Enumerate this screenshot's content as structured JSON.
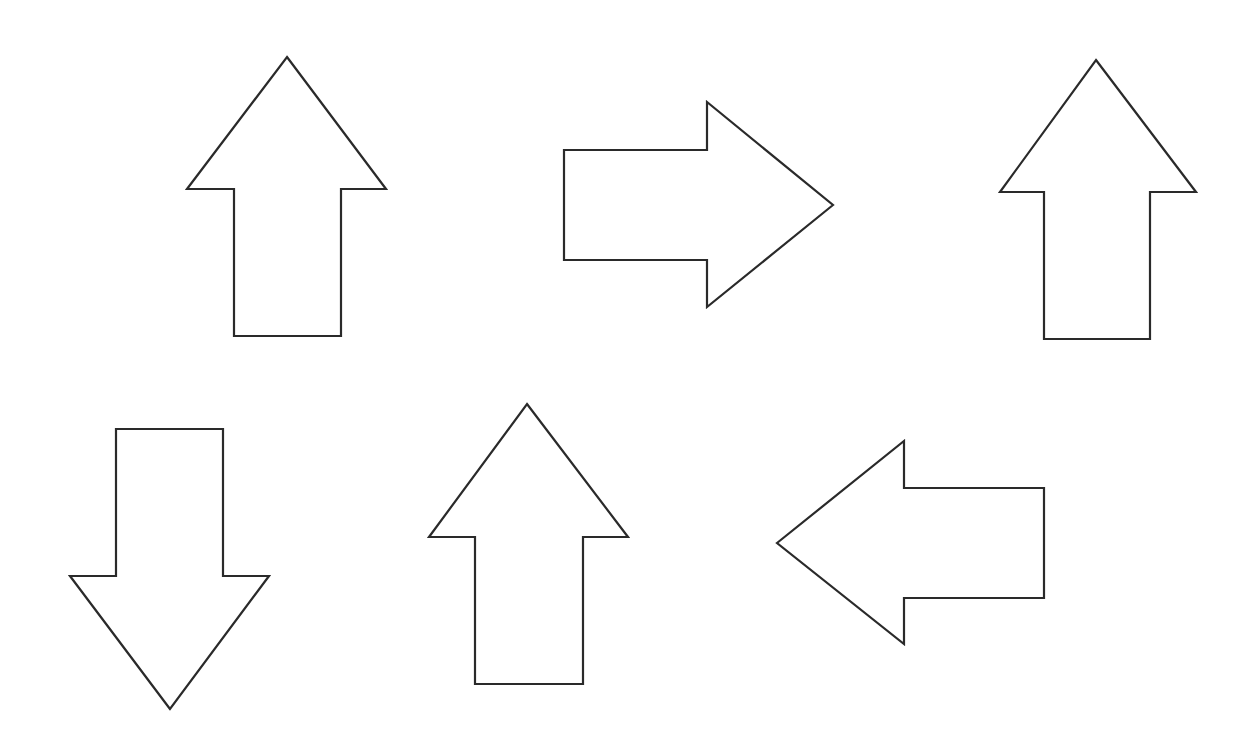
{
  "canvas": {
    "width": 1256,
    "height": 747,
    "background": "#ffffff",
    "stroke_color": "#2a2a2a",
    "fill_color": "#ffffff"
  },
  "arrows": [
    {
      "id": "arrow-1",
      "direction": "up",
      "position": "top-left",
      "points": "287,57 386,189 341,189 341,336 234,336 234,189 187,189"
    },
    {
      "id": "arrow-2",
      "direction": "right",
      "position": "top-center",
      "points": "833,205 707,307 707,260 564,260 564,150 707,150 707,102"
    },
    {
      "id": "arrow-3",
      "direction": "up",
      "position": "top-right",
      "points": "1096,60 1196,192 1150,192 1150,339 1044,339 1044,192 1000,192"
    },
    {
      "id": "arrow-4",
      "direction": "down",
      "position": "bottom-left",
      "points": "170,709 70,576 116,576 116,429 223,429 223,576 269,576"
    },
    {
      "id": "arrow-5",
      "direction": "up",
      "position": "bottom-center",
      "points": "527,404 628,537 583,537 583,684 475,684 475,537 429,537"
    },
    {
      "id": "arrow-6",
      "direction": "left",
      "position": "bottom-right",
      "points": "777,543 904,441 904,488 1044,488 1044,598 904,598 904,644"
    }
  ]
}
